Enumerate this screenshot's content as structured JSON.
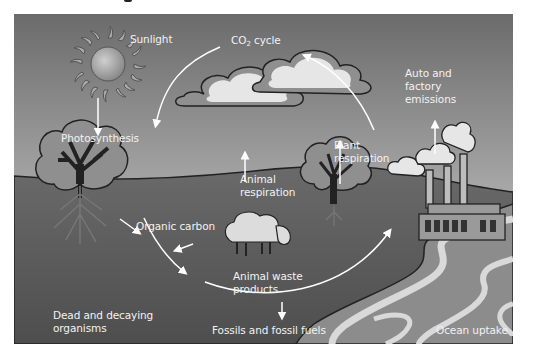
{
  "diagram": {
    "type": "carbon-cycle-illustration",
    "colors": {
      "sky_top": "#6b6b6b",
      "sky_bottom": "#c4c4c4",
      "ground": "#5a5a5a",
      "ocean": "#8c8c8c",
      "ocean_waves": "#d9d9d9",
      "arrow": "#ffffff",
      "label": "#f2f2f2",
      "outline": "#222222",
      "tree_crown": "#8f8f8f",
      "cloud": "#e6e6e6"
    },
    "labels": {
      "sunlight": "Sunlight",
      "co2_cycle_prefix": "CO",
      "co2_cycle_sub": "2",
      "co2_cycle_suffix": " cycle",
      "auto_emissions_1": "Auto and",
      "auto_emissions_2": "factory",
      "auto_emissions_3": "emissions",
      "photosynthesis": "Photosynthesis",
      "plant_respiration_1": "Plant",
      "plant_respiration_2": "respiration",
      "animal_respiration_1": "Animal",
      "animal_respiration_2": "respiration",
      "organic_carbon": "Organic carbon",
      "animal_waste_1": "Animal waste",
      "animal_waste_2": "products",
      "dead_decaying_1": "Dead and decaying",
      "dead_decaying_2": "organisms",
      "fossils": "Fossils and fossil fuels",
      "ocean_uptake": "Ocean uptake"
    },
    "elements": [
      "sun",
      "clouds",
      "left-tree",
      "right-tree",
      "sheep",
      "factory",
      "ocean",
      "cycle-arrows"
    ]
  }
}
